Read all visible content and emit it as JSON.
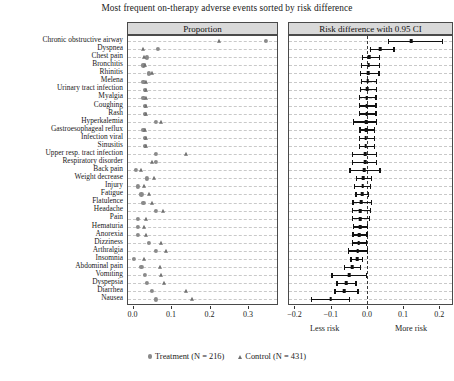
{
  "chart_data": {
    "type": "scatter",
    "title": "Most frequent on-therapy adverse events sorted by risk difference",
    "panels": [
      {
        "id": "proportion",
        "header": "Proportion",
        "xlabel": "",
        "xlim": [
          -0.012,
          0.375
        ],
        "ticks": [
          0.0,
          0.1,
          0.2,
          0.3
        ],
        "tick_labels": [
          "0.0",
          "0.1",
          "0.2",
          "0.3"
        ],
        "grid": true
      },
      {
        "id": "riskdiff",
        "header": "Risk difference with 0.95 CI",
        "xlabel": "",
        "xlim": [
          -0.215,
          0.235
        ],
        "ticks": [
          -0.2,
          -0.1,
          0.0,
          0.1,
          0.2
        ],
        "tick_labels": [
          "−0.2",
          "−0.1",
          "0.0",
          "0.1",
          "0.2"
        ],
        "zero_reference": 0.0,
        "note_left": "Less risk",
        "note_right": "More risk",
        "grid": true
      }
    ],
    "categories": [
      "Chronic obstructive airway",
      "Dyspnea",
      "Chest pain",
      "Bronchitis",
      "Rhinitis",
      "Melena",
      "Urinary tract infection",
      "Myalgia",
      "Coughing",
      "Rash",
      "Hyperkalemia",
      "Gastroesophageal reflux",
      "Infection viral",
      "Sinusitis",
      "Upper resp. tract infection",
      "Respiratory disorder",
      "Back pain",
      "Weight decrease",
      "Injury",
      "Fatigue",
      "Flatulence",
      "Headache",
      "Pain",
      "Hematuria",
      "Anorexia",
      "Dizziness",
      "Arthralgia",
      "Insomnia",
      "Abdominal pain",
      "Vomiting",
      "Dyspepsia",
      "Diarrhea",
      "Nausea"
    ],
    "series": [
      {
        "name": "Treatment (N = 216)",
        "marker": "circle",
        "color": "#8a8a8a",
        "values": [
          0.347,
          0.065,
          0.037,
          0.028,
          0.042,
          0.028,
          0.032,
          0.028,
          0.032,
          0.032,
          0.06,
          0.028,
          0.032,
          0.032,
          0.06,
          0.06,
          0.009,
          0.037,
          0.014,
          0.023,
          0.028,
          0.06,
          0.014,
          0.014,
          0.014,
          0.042,
          0.06,
          0.004,
          0.023,
          0.032,
          0.037,
          0.051,
          0.06
        ]
      },
      {
        "name": "Control (N = 431)",
        "marker": "triangle",
        "color": "#6f6f6f",
        "values": [
          0.225,
          0.028,
          0.03,
          0.032,
          0.051,
          0.035,
          0.035,
          0.035,
          0.035,
          0.035,
          0.074,
          0.032,
          0.035,
          0.035,
          0.139,
          0.051,
          0.023,
          0.056,
          0.03,
          0.042,
          0.051,
          0.079,
          0.035,
          0.03,
          0.035,
          0.074,
          0.086,
          0.03,
          0.072,
          0.074,
          0.081,
          0.139,
          0.153
        ]
      }
    ],
    "risk_difference": [
      {
        "event": "Chronic obstructive airway",
        "estimate": 0.122,
        "lower": 0.058,
        "upper": 0.211
      },
      {
        "event": "Dyspnea",
        "estimate": 0.037,
        "lower": 0.008,
        "upper": 0.077
      },
      {
        "event": "Chest pain",
        "estimate": 0.007,
        "lower": -0.013,
        "upper": 0.037
      },
      {
        "event": "Bronchitis",
        "estimate": 0.005,
        "lower": -0.016,
        "upper": 0.037
      },
      {
        "event": "Rhinitis",
        "estimate": 0.004,
        "lower": -0.019,
        "upper": 0.035
      },
      {
        "event": "Melena",
        "estimate": 0.002,
        "lower": -0.017,
        "upper": 0.028
      },
      {
        "event": "Urinary tract infection",
        "estimate": 0.001,
        "lower": -0.02,
        "upper": 0.028
      },
      {
        "event": "Myalgia",
        "estimate": 0.0,
        "lower": -0.022,
        "upper": 0.027
      },
      {
        "event": "Coughing",
        "estimate": 0.0,
        "lower": -0.022,
        "upper": 0.027
      },
      {
        "event": "Rash",
        "estimate": 0.0,
        "lower": -0.023,
        "upper": 0.027
      },
      {
        "event": "Hyperkalemia",
        "estimate": -0.002,
        "lower": -0.038,
        "upper": 0.028
      },
      {
        "event": "Gastroesophageal reflux",
        "estimate": -0.002,
        "lower": -0.021,
        "upper": 0.023
      },
      {
        "event": "Infection viral",
        "estimate": -0.003,
        "lower": -0.022,
        "upper": 0.022
      },
      {
        "event": "Sinusitis",
        "estimate": -0.003,
        "lower": -0.022,
        "upper": 0.022
      },
      {
        "event": "Upper resp. tract infection",
        "estimate": -0.004,
        "lower": -0.041,
        "upper": 0.029
      },
      {
        "event": "Respiratory disorder",
        "estimate": -0.005,
        "lower": -0.041,
        "upper": 0.028
      },
      {
        "event": "Back pain",
        "estimate": -0.008,
        "lower": -0.048,
        "upper": 0.038
      },
      {
        "event": "Weight decrease",
        "estimate": -0.01,
        "lower": -0.03,
        "upper": 0.014
      },
      {
        "event": "Injury",
        "estimate": -0.012,
        "lower": -0.035,
        "upper": 0.012
      },
      {
        "event": "Fatigue",
        "estimate": -0.013,
        "lower": -0.032,
        "upper": 0.007
      },
      {
        "event": "Flatulence",
        "estimate": -0.016,
        "lower": -0.04,
        "upper": 0.014
      },
      {
        "event": "Headache",
        "estimate": -0.018,
        "lower": -0.042,
        "upper": 0.012
      },
      {
        "event": "Pain",
        "estimate": -0.018,
        "lower": -0.041,
        "upper": 0.009
      },
      {
        "event": "Hematuria",
        "estimate": -0.019,
        "lower": -0.038,
        "upper": 0.003
      },
      {
        "event": "Anorexia",
        "estimate": -0.021,
        "lower": -0.04,
        "upper": 0.002
      },
      {
        "event": "Dizziness",
        "estimate": -0.022,
        "lower": -0.042,
        "upper": 0.001
      },
      {
        "event": "Arthralgia",
        "estimate": -0.025,
        "lower": -0.053,
        "upper": 0.003
      },
      {
        "event": "Insomnia",
        "estimate": -0.027,
        "lower": -0.046,
        "upper": -0.01
      },
      {
        "event": "Abdominal pain",
        "estimate": -0.04,
        "lower": -0.063,
        "upper": -0.015
      },
      {
        "event": "Vomiting",
        "estimate": -0.049,
        "lower": -0.098,
        "upper": 0.0
      },
      {
        "event": "Dyspepsia",
        "estimate": -0.057,
        "lower": -0.084,
        "upper": -0.028
      },
      {
        "event": "Diarrhea",
        "estimate": -0.062,
        "lower": -0.09,
        "upper": -0.023
      },
      {
        "event": "Nausea",
        "estimate": -0.1,
        "lower": -0.155,
        "upper": -0.046
      },
      {
        "event": "Nausea2",
        "estimate": -0.145,
        "lower": -0.19,
        "upper": -0.098
      }
    ],
    "legend": {
      "position": "bottom-center",
      "entries": [
        {
          "label": "Treatment (N = 216)",
          "marker": "circle"
        },
        {
          "label": "Control (N = 431)",
          "marker": "triangle"
        }
      ]
    }
  }
}
